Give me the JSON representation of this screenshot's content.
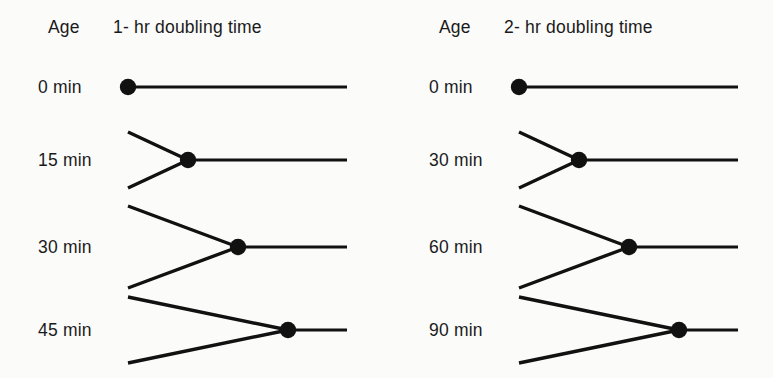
{
  "figure": {
    "background_color": "#fbfbfa",
    "ink_color": "#111111",
    "age_header": "Age"
  },
  "chart_data": {
    "type": "diagram",
    "geometry": {
      "line_right_end": 347,
      "arm_left_end": 128,
      "dot_radius": 8.2,
      "row_centers": [
        87,
        160,
        247,
        330
      ]
    },
    "panels": [
      {
        "name": "one-hour",
        "header": "1- hr doubling time",
        "age_header": "Age",
        "doubling_time_minutes": 60,
        "rows": [
          {
            "age_label": "0 min",
            "age_minutes": 0,
            "row_center_y": 87,
            "vertex_x": 128,
            "fork_open": false,
            "arm_half_spread": 0
          },
          {
            "age_label": "15 min",
            "age_minutes": 15,
            "row_center_y": 160,
            "vertex_x": 188,
            "fork_open": true,
            "arm_half_spread": 28
          },
          {
            "age_label": "30 min",
            "age_minutes": 30,
            "row_center_y": 247,
            "vertex_x": 238,
            "fork_open": true,
            "arm_half_spread": 41
          },
          {
            "age_label": "45 min",
            "age_minutes": 45,
            "row_center_y": 330,
            "vertex_x": 288,
            "fork_open": true,
            "arm_half_spread": 33
          }
        ]
      },
      {
        "name": "two-hour",
        "header": "2- hr doubling time",
        "age_header": "Age",
        "doubling_time_minutes": 120,
        "rows": [
          {
            "age_label": "0 min",
            "age_minutes": 0,
            "row_center_y": 87,
            "vertex_x": 128,
            "fork_open": false,
            "arm_half_spread": 0
          },
          {
            "age_label": "30 min",
            "age_minutes": 30,
            "row_center_y": 160,
            "vertex_x": 188,
            "fork_open": true,
            "arm_half_spread": 28
          },
          {
            "age_label": "60 min",
            "age_minutes": 60,
            "row_center_y": 247,
            "vertex_x": 238,
            "fork_open": true,
            "arm_half_spread": 41
          },
          {
            "age_label": "90 min",
            "age_minutes": 90,
            "row_center_y": 330,
            "vertex_x": 288,
            "fork_open": true,
            "arm_half_spread": 33
          }
        ]
      }
    ]
  }
}
